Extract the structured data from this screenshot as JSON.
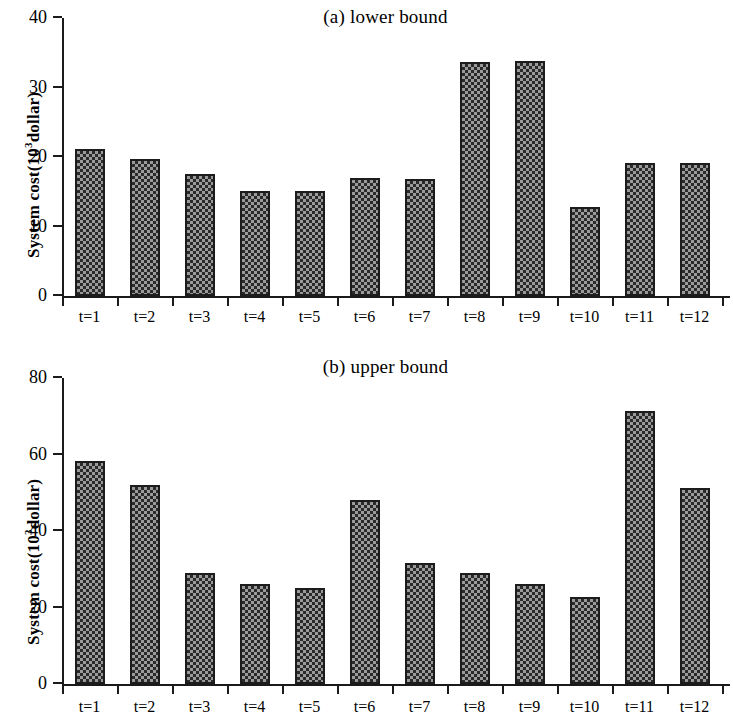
{
  "figure": {
    "panels": [
      {
        "key": "a",
        "title": "(a) lower bound",
        "ylabel_main": "System cost(10",
        "ylabel_sup": "3",
        "ylabel_tail": "dollar)"
      },
      {
        "key": "b",
        "title": "(b) upper bound",
        "ylabel_main": "System cost(10",
        "ylabel_sup": "3",
        "ylabel_tail": "dollar)"
      }
    ]
  },
  "chart_data": [
    {
      "type": "bar",
      "title": "(a) lower bound",
      "xlabel": "",
      "ylabel": "System cost(10^3 dollar)",
      "categories": [
        "t=1",
        "t=2",
        "t=3",
        "t=4",
        "t=5",
        "t=6",
        "t=7",
        "t=8",
        "t=9",
        "t=10",
        "t=11",
        "t=12"
      ],
      "values": [
        21.2,
        19.7,
        17.6,
        15.1,
        15.1,
        17.0,
        16.9,
        33.6,
        33.8,
        12.8,
        19.2,
        19.1
      ],
      "ylim": [
        0,
        40
      ],
      "yticks": [
        0,
        10,
        20,
        30,
        40
      ],
      "ytick_labels": [
        "0",
        "10",
        "20",
        "30",
        "40"
      ],
      "grid": false,
      "legend": "none",
      "bar_fill": "#9a9a9a",
      "bar_edge": "#1c1c1c"
    },
    {
      "type": "bar",
      "title": "(b) upper bound",
      "xlabel": "",
      "ylabel": "System cost(10^3 dollar)",
      "categories": [
        "t=1",
        "t=2",
        "t=3",
        "t=4",
        "t=5",
        "t=6",
        "t=7",
        "t=8",
        "t=9",
        "t=10",
        "t=11",
        "t=12"
      ],
      "values": [
        58.4,
        52.1,
        29.0,
        26.2,
        25.2,
        48.0,
        31.6,
        28.9,
        26.2,
        22.8,
        71.4,
        51.2
      ],
      "ylim": [
        0,
        80
      ],
      "yticks": [
        0,
        20,
        40,
        60,
        80
      ],
      "ytick_labels": [
        "0",
        "20",
        "40",
        "60",
        "80"
      ],
      "grid": false,
      "legend": "none",
      "bar_fill": "#9a9a9a",
      "bar_edge": "#1c1c1c"
    }
  ]
}
